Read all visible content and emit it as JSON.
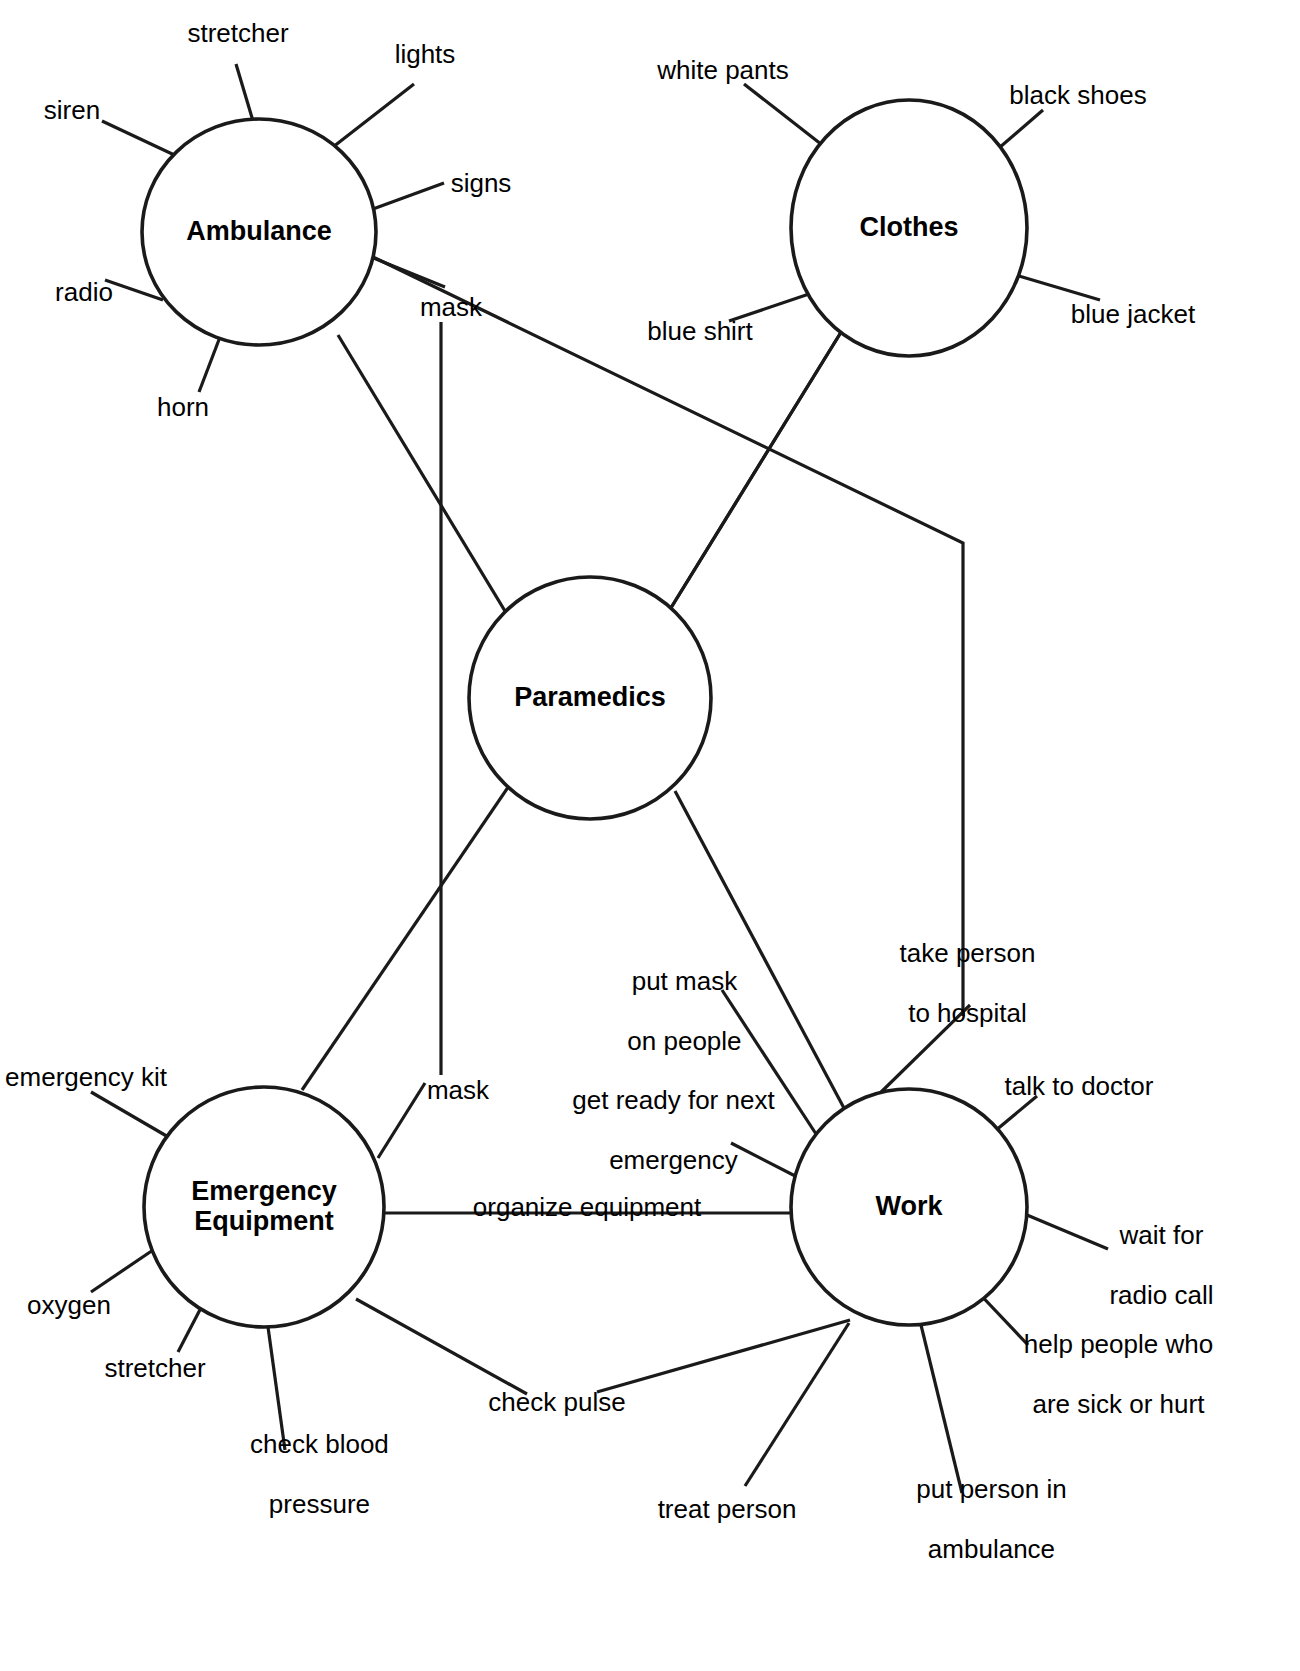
{
  "diagram": {
    "background_color": "#ffffff",
    "line_color": "#1a1a1a",
    "nodes": [
      {
        "id": "ambulance",
        "label": "Ambulance",
        "cx": 259,
        "cy": 232,
        "rx": 117,
        "ry": 113
      },
      {
        "id": "clothes",
        "label": "Clothes",
        "cx": 909,
        "cy": 228,
        "rx": 118,
        "ry": 128
      },
      {
        "id": "paramedics",
        "label": "Paramedics",
        "cx": 590,
        "cy": 698,
        "rx": 121,
        "ry": 121
      },
      {
        "id": "emergency_equipment",
        "label": "Emergency\nEquipment",
        "label_line1": "Emergency",
        "label_line2": "Equipment",
        "cx": 264,
        "cy": 1207,
        "rx": 120,
        "ry": 120
      },
      {
        "id": "work",
        "label": "Work",
        "cx": 909,
        "cy": 1207,
        "rx": 118,
        "ry": 118
      }
    ],
    "leaves": [
      {
        "id": "a-stretcher",
        "parent": "ambulance",
        "text": "stretcher",
        "x": 238,
        "y": 33,
        "align": "center"
      },
      {
        "id": "a-lights",
        "parent": "ambulance",
        "text": "lights",
        "x": 425,
        "y": 54,
        "align": "center"
      },
      {
        "id": "a-siren",
        "parent": "ambulance",
        "text": "siren",
        "x": 72,
        "y": 110,
        "align": "center"
      },
      {
        "id": "a-signs",
        "parent": "ambulance",
        "text": "signs",
        "x": 481,
        "y": 183,
        "align": "center"
      },
      {
        "id": "a-radio",
        "parent": "ambulance",
        "text": "radio",
        "x": 84,
        "y": 292,
        "align": "center"
      },
      {
        "id": "a-mask",
        "parent": "ambulance",
        "text": "mask",
        "x": 451,
        "y": 307,
        "align": "center"
      },
      {
        "id": "a-horn",
        "parent": "ambulance",
        "text": "horn",
        "x": 183,
        "y": 407,
        "align": "center"
      },
      {
        "id": "c-white-pants",
        "parent": "clothes",
        "text": "white pants",
        "x": 723,
        "y": 70,
        "align": "center"
      },
      {
        "id": "c-black-shoes",
        "parent": "clothes",
        "text": "black shoes",
        "x": 1078,
        "y": 95,
        "align": "center"
      },
      {
        "id": "c-blue-shirt",
        "parent": "clothes",
        "text": "blue shirt",
        "x": 700,
        "y": 331,
        "align": "center"
      },
      {
        "id": "c-blue-jacket",
        "parent": "clothes",
        "text": "blue jacket",
        "x": 1133,
        "y": 314,
        "align": "center"
      },
      {
        "id": "e-emergency-kit",
        "parent": "emergency_equipment",
        "text": "emergency kit",
        "x": 86,
        "y": 1077,
        "align": "center"
      },
      {
        "id": "e-mask",
        "parent": "emergency_equipment",
        "text": "mask",
        "x": 458,
        "y": 1090,
        "align": "center"
      },
      {
        "id": "e-oxygen",
        "parent": "emergency_equipment",
        "text": "oxygen",
        "x": 69,
        "y": 1305,
        "align": "center"
      },
      {
        "id": "e-stretcher",
        "parent": "emergency_equipment",
        "text": "stretcher",
        "x": 155,
        "y": 1368,
        "align": "center"
      },
      {
        "id": "e-check-blood-pressure",
        "parent": "emergency_equipment",
        "text": "check blood\npressure",
        "line1": "check blood",
        "line2": "pressure",
        "x": 305,
        "y": 1474,
        "align": "center"
      },
      {
        "id": "w-put-mask-on-people",
        "parent": "work",
        "text": "put mask\non people",
        "line1": "put mask",
        "line2": "on people",
        "x": 670,
        "y": 1011,
        "align": "center"
      },
      {
        "id": "w-take-person-to-hospital",
        "parent": "work",
        "text": "take person\nto hospital",
        "line1": "take person",
        "line2": "to hospital",
        "x": 953,
        "y": 983,
        "align": "center"
      },
      {
        "id": "w-talk-to-doctor",
        "parent": "work",
        "text": "talk to doctor",
        "x": 1079,
        "y": 1086,
        "align": "center"
      },
      {
        "id": "w-get-ready",
        "parent": "work",
        "text": "get ready for next\nemergency",
        "line1": "get ready for next",
        "line2": "emergency",
        "x": 659,
        "y": 1130,
        "align": "center"
      },
      {
        "id": "w-organize-equipment",
        "parent": "work",
        "text": "organize equipment",
        "x": 587,
        "y": 1207,
        "align": "center"
      },
      {
        "id": "w-wait-for-radio-call",
        "parent": "work",
        "text": "wait for\nradio call",
        "line1": "wait for",
        "line2": "radio call",
        "x": 1147,
        "y": 1265,
        "align": "center"
      },
      {
        "id": "w-check-pulse",
        "parent": "work",
        "text": "check pulse",
        "x": 557,
        "y": 1402,
        "align": "center"
      },
      {
        "id": "w-help-people",
        "parent": "work",
        "text": "help people who\nare sick or hurt",
        "line1": "help people who",
        "line2": "are sick or hurt",
        "x": 1104,
        "y": 1374,
        "align": "center"
      },
      {
        "id": "w-treat-person",
        "parent": "work",
        "text": "treat person",
        "x": 727,
        "y": 1509,
        "align": "center"
      },
      {
        "id": "w-put-person-in-ambulance",
        "parent": "work",
        "text": "put person in\nambulance",
        "line1": "put person in",
        "line2": "ambulance",
        "x": 977,
        "y": 1519,
        "align": "center"
      }
    ],
    "connections": [
      {
        "from": "ambulance",
        "to": "paramedics"
      },
      {
        "from": "ambulance",
        "to": "work"
      },
      {
        "from": "clothes",
        "to": "paramedics"
      },
      {
        "from": "clothes",
        "to": "work"
      },
      {
        "from": "paramedics",
        "to": "emergency_equipment"
      },
      {
        "from": "paramedics",
        "to": "work"
      },
      {
        "from": "emergency_equipment",
        "to": "work"
      }
    ]
  }
}
